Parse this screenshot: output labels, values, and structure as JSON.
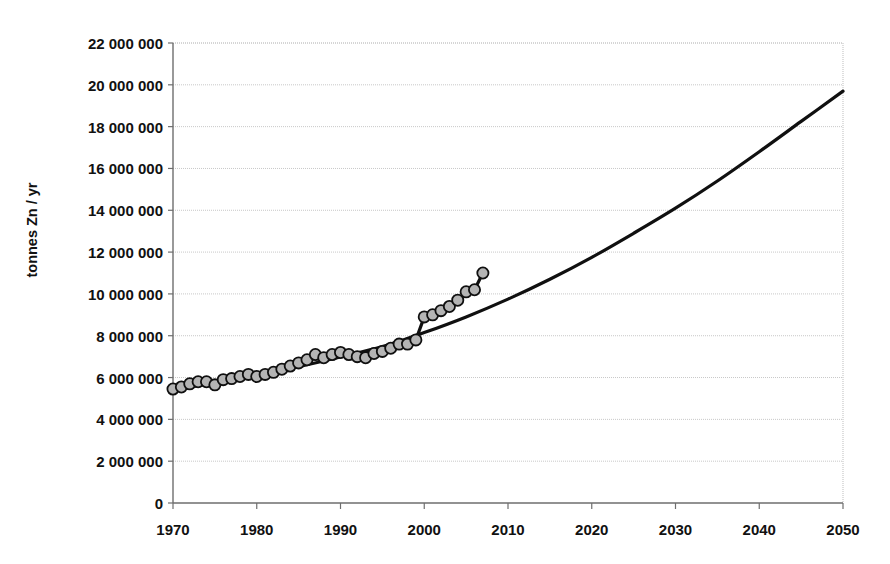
{
  "chart_data": {
    "type": "line",
    "title": "",
    "subtitle": "",
    "xlabel": "",
    "ylabel": "tonnes Zn / yr",
    "xlim": [
      1970,
      2050
    ],
    "ylim": [
      0,
      22000000
    ],
    "grid": true,
    "legend": "none",
    "ytick_labels": [
      "22 000 000",
      "20 000 000",
      "18 000 000",
      "16 000 000",
      "14 000 000",
      "12 000 000",
      "10 000 000",
      "8 000 000",
      "6 000 000",
      "4 000 000",
      "2 000 000",
      "0"
    ],
    "ytick_values": [
      22000000,
      20000000,
      18000000,
      16000000,
      14000000,
      12000000,
      10000000,
      8000000,
      6000000,
      4000000,
      2000000,
      0
    ],
    "xtick_labels": [
      "1970",
      "1980",
      "1990",
      "2000",
      "2010",
      "2020",
      "2030",
      "2040",
      "2050"
    ],
    "xtick_values": [
      1970,
      1980,
      1990,
      2000,
      2010,
      2020,
      2030,
      2040,
      2050
    ],
    "series": [
      {
        "name": "Historical zinc production",
        "marker": "filled-gray-circle",
        "marker_color": "#b4b4b4",
        "marker_edge_color": "#101010",
        "line_color": "#101010",
        "x": [
          1970,
          1971,
          1972,
          1973,
          1974,
          1975,
          1976,
          1977,
          1978,
          1979,
          1980,
          1981,
          1982,
          1983,
          1984,
          1985,
          1986,
          1987,
          1988,
          1989,
          1990,
          1991,
          1992,
          1993,
          1994,
          1995,
          1996,
          1997,
          1998,
          1999,
          2000,
          2001,
          2002,
          2003,
          2004,
          2005,
          2006,
          2007
        ],
        "y": [
          5450000,
          5550000,
          5700000,
          5800000,
          5800000,
          5650000,
          5900000,
          5950000,
          6050000,
          6150000,
          6050000,
          6150000,
          6250000,
          6400000,
          6550000,
          6700000,
          6850000,
          7100000,
          6950000,
          7100000,
          7200000,
          7100000,
          7000000,
          6950000,
          7150000,
          7250000,
          7400000,
          7600000,
          7600000,
          7800000,
          8900000,
          9000000,
          9200000,
          9400000,
          9700000,
          10100000,
          10200000,
          11000000
        ]
      },
      {
        "name": "Projected trend (exponential fit)",
        "marker": "none",
        "line_color": "#101010",
        "x": [
          1970,
          1975,
          1980,
          1985,
          1990,
          1995,
          2000,
          2005,
          2010,
          2015,
          2020,
          2025,
          2030,
          2035,
          2040,
          2045,
          2050
        ],
        "y": [
          5400000,
          5750000,
          6120000,
          6520000,
          6980000,
          7480000,
          8150000,
          8900000,
          9750000,
          10700000,
          11750000,
          12900000,
          14100000,
          15400000,
          16800000,
          18250000,
          19700000
        ]
      }
    ],
    "colors": {
      "axis": "#6e6e6e",
      "gridline": "#c8c8c8",
      "plot_background": "#ffffff",
      "data_line": "#101010",
      "marker_fill": "#b4b4b4"
    },
    "geometry": {
      "plot_left": 173,
      "plot_right": 843,
      "plot_top": 43,
      "plot_bottom": 503
    }
  }
}
